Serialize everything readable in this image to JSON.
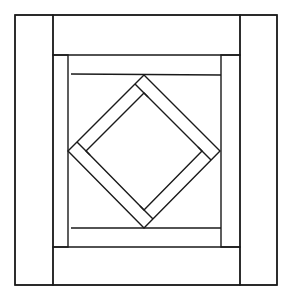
{
  "diagram": {
    "colors": {
      "background": "#ffffff",
      "stroke": "#1a1a1a"
    },
    "stroke_width": 1.4,
    "outer_frame": {
      "x1": 15,
      "y1": 15,
      "x2": 277,
      "y2": 285
    },
    "strips": [
      {
        "name": "left-strip",
        "points": [
          [
            15,
            15
          ],
          [
            53,
            15
          ],
          [
            53,
            285
          ],
          [
            15,
            285
          ]
        ]
      },
      {
        "name": "top-strip",
        "points": [
          [
            53,
            15
          ],
          [
            240,
            15
          ],
          [
            240,
            55
          ],
          [
            53,
            55
          ]
        ]
      },
      {
        "name": "right-strip",
        "points": [
          [
            240,
            15
          ],
          [
            277,
            15
          ],
          [
            277,
            285
          ],
          [
            240,
            285
          ]
        ]
      },
      {
        "name": "bottom-strip",
        "points": [
          [
            53,
            247
          ],
          [
            240,
            247
          ],
          [
            240,
            285
          ],
          [
            53,
            285
          ]
        ]
      },
      {
        "name": "inner-left-strip",
        "points": [
          [
            53,
            55
          ],
          [
            68,
            55
          ],
          [
            68,
            247
          ],
          [
            53,
            247
          ]
        ]
      },
      {
        "name": "inner-right-strip",
        "points": [
          [
            221,
            55
          ],
          [
            240,
            55
          ],
          [
            240,
            247
          ],
          [
            221,
            247
          ]
        ]
      }
    ],
    "inner_lines": [
      {
        "name": "inner-top-line",
        "x1": 71,
        "y1": 74,
        "x2": 221,
        "y2": 75
      },
      {
        "name": "inner-bottom-line",
        "x1": 71,
        "y1": 228,
        "x2": 221,
        "y2": 228
      }
    ],
    "diamond_outer": [
      [
        144,
        75
      ],
      [
        220,
        151
      ],
      [
        144,
        228
      ],
      [
        68,
        151
      ]
    ],
    "diamond_inner": [
      [
        144,
        93
      ],
      [
        202,
        151
      ],
      [
        144,
        210
      ],
      [
        86,
        151
      ]
    ],
    "diamond_caps": [
      {
        "x1": 135,
        "y1": 84,
        "x2": 148,
        "y2": 97
      },
      {
        "x1": 77,
        "y1": 142,
        "x2": 90,
        "y2": 155
      },
      {
        "x1": 140,
        "y1": 206,
        "x2": 153,
        "y2": 219
      },
      {
        "x1": 198,
        "y1": 147,
        "x2": 211,
        "y2": 160
      }
    ]
  }
}
